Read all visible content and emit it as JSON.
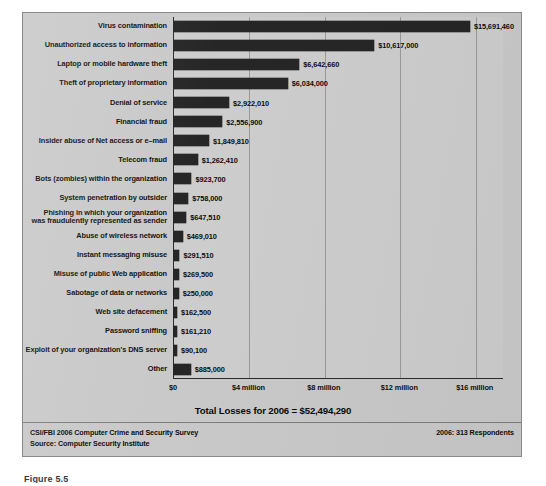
{
  "chart_data": {
    "type": "bar",
    "orientation": "horizontal",
    "title": "",
    "xlabel": "",
    "ylabel": "",
    "xlim": [
      0,
      17500000
    ],
    "grid": true,
    "legend": "none",
    "tick_labels": [
      "$0",
      "$4 million",
      "$8 million",
      "$12 million",
      "$16 million"
    ],
    "tick_values": [
      0,
      4000000,
      8000000,
      12000000,
      16000000
    ],
    "categories": [
      "Virus contamination",
      "Unauthorized access to information",
      "Laptop or mobile hardware theft",
      "Theft of proprietary information",
      "Denial of service",
      "Financial fraud",
      "Insider abuse of Net access or e–mail",
      "Telecom fraud",
      "Bots (zombies) within the organization",
      "System penetration by outsider",
      "Phishing in which your organization\nwas fraudulently represented as sender",
      "Abuse of wireless network",
      "Instant messaging misuse",
      "Misuse of public Web application",
      "Sabotage of data or networks",
      "Web site defacement",
      "Password sniffing",
      "Exploit of your organization's DNS server",
      "Other"
    ],
    "values": [
      15691460,
      10617000,
      6642660,
      6034000,
      2922010,
      2556900,
      1849810,
      1262410,
      923700,
      758000,
      647510,
      469010,
      291510,
      269500,
      250000,
      162500,
      161210,
      90100,
      885000
    ],
    "value_labels": [
      "$15,691,460",
      "$10,617,000",
      "$6,642,660",
      "$6,034,000",
      "$2,922,010",
      "$2,556,900",
      "$1,849,810",
      "$1,262,410",
      "$923,700",
      "$758,000",
      "$647,510",
      "$469,010",
      "$291,510",
      "$269,500",
      "$250,000",
      "$162,500",
      "$161,210",
      "$90,100",
      "$885,000"
    ],
    "bar_color": "#262626",
    "plot_background": "#cdcdcd"
  },
  "total_line": "Total Losses for 2006 = $52,494,290",
  "footer": {
    "left_line1": "CSI/FBI 2006 Computer Crime and Security Survey",
    "left_line2": "Source: Computer Security Institute",
    "right": "2006: 313 Respondents"
  },
  "caption": "Figure 5.5"
}
